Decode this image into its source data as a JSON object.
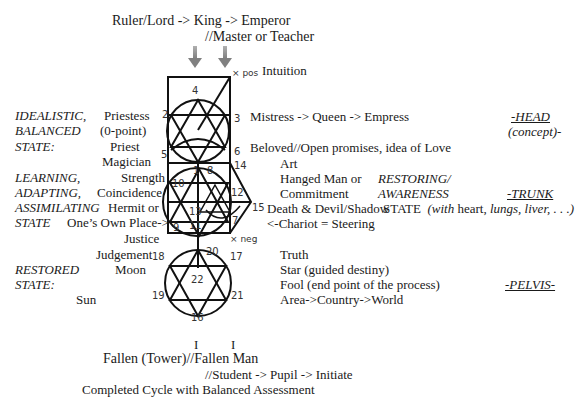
{
  "top": {
    "line1": "Ruler/Lord -> King -> Emperor",
    "line2": "//Master or Teacher",
    "intuition": "Intuition",
    "x_pos": "× pos",
    "x_neg": "× neg"
  },
  "left": {
    "idealistic": [
      "IDEALISTIC,",
      "BALANCED",
      "STATE:"
    ],
    "idealistic_items": [
      "Priestess",
      "(0-point)",
      "Priest",
      "Magician"
    ],
    "learning": [
      "LEARNING,",
      "ADAPTING,",
      "ASSIMILATING",
      "STATE"
    ],
    "learning_items": [
      "Strength",
      "Coincidence",
      "Hermit or",
      "One’s Own Place->",
      "Justice",
      "Judgement"
    ],
    "restored": [
      "RESTORED",
      "STATE:"
    ],
    "restored_items": [
      "Moon",
      "Sun"
    ]
  },
  "right": {
    "head_lines": [
      "Mistress -> Queen -> Empress",
      "Beloved//Open promises, idea of Love"
    ],
    "head_label": "-HEAD",
    "head_sub": "(concept)-",
    "trunk_items": [
      "Art",
      "Hanged Man or",
      "Commitment",
      "Death & Devil/Shadow",
      "<-Chariot = Steering"
    ],
    "restoring": [
      "RESTORING/",
      "AWARENESS"
    ],
    "trunk_label": "-TRUNK",
    "state_word": "STATE",
    "trunk_with": "with",
    "trunk_heart": " heart, ",
    "trunk_organs": "lungs, liver, . . .)",
    "trunk_open": "(",
    "pelvis_items": [
      "Truth",
      "Star (guided destiny)",
      "Fool (end point of the process)",
      "Area->Country->World"
    ],
    "pelvis_label": "-PELVIS-"
  },
  "numbers": {
    "n1": "1",
    "n2": "2",
    "n3": "3",
    "n4": "4",
    "n5": "5",
    "n6": "6",
    "n7": "7",
    "n8": "8",
    "n9": "9",
    "n10": "10",
    "n11": "11",
    "n12": "12",
    "n13": "13",
    "n14": "14",
    "n15": "15",
    "n16": "16",
    "n17": "17",
    "n18": "18",
    "n19": "19",
    "n20": "20",
    "n21": "21",
    "n22": "22"
  },
  "bottom": {
    "pillars": [
      "I",
      "I"
    ],
    "fallen": "Fallen (Tower)//Fallen Man",
    "student": "//Student -> Pupil -> Initiate",
    "completed": "Completed Cycle with Balanced Assessment"
  },
  "colors": {
    "ink": "#1a1a1a",
    "arrow": "#8a8a8a"
  }
}
